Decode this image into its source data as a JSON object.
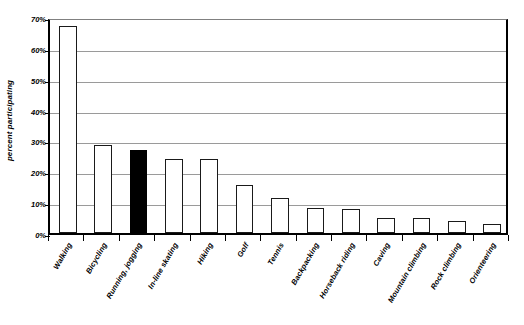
{
  "chart_data": {
    "type": "bar",
    "title": "",
    "subtitle": "",
    "xlabel": "",
    "ylabel": "percent participating",
    "ylim": [
      0,
      70
    ],
    "ytick_labels": [
      "0%",
      "10%",
      "20%",
      "30%",
      "40%",
      "50%",
      "60%",
      "70%"
    ],
    "ytick_values": [
      0,
      10,
      20,
      30,
      40,
      50,
      60,
      70
    ],
    "grid": true,
    "legend": false,
    "highlight_category": "Running, jogging",
    "highlight_color": "#000000",
    "bar_fill_color": "#ffffff",
    "bar_edge_color": "#000000",
    "gridline_color": "#9a9a9a",
    "axis_color": "#000000",
    "categories": [
      "Walking",
      "Bicycling",
      "Running, jogging",
      "In-line skating",
      "Hiking",
      "Golf",
      "Tennis",
      "Backpacking",
      "Horseback riding",
      "Caving",
      "Mountain climbing",
      "Rock climbing",
      "Orienteering"
    ],
    "values": [
      67,
      28.5,
      27,
      24,
      24,
      15.5,
      11.3,
      8,
      7.7,
      5,
      5,
      4,
      3
    ]
  }
}
